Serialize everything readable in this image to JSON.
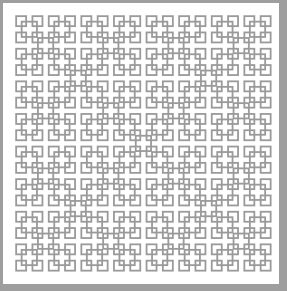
{
  "title": "Box fractal curve pattern",
  "pattern": {
    "grid_cells": 16,
    "origin_x": 10,
    "origin_y": 10,
    "cell_pitch": 16.3,
    "square_size": 10,
    "stroke_width": 1.8,
    "levels": 4
  },
  "colors": {
    "stroke": "#9a9a9a",
    "background": "#ffffff",
    "border": "#9e9e9e"
  }
}
